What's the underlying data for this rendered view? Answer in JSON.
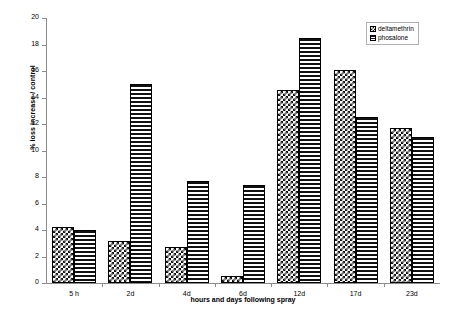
{
  "chart_data": {
    "type": "bar",
    "title": "",
    "xlabel": "hours and days following spray",
    "ylabel": "% loss increase / control",
    "categories": [
      "5 h",
      "2d",
      "4d",
      "6d",
      "12d",
      "17d",
      "23d"
    ],
    "series": [
      {
        "name": "deltamethrin",
        "values": [
          4.2,
          3.2,
          2.7,
          0.5,
          14.6,
          16.1,
          11.7
        ]
      },
      {
        "name": "phosalone",
        "values": [
          4.0,
          15.0,
          7.7,
          7.4,
          18.5,
          12.5,
          11.0
        ]
      }
    ],
    "ylim": [
      0,
      20
    ],
    "yticks": [
      0,
      2,
      4,
      6,
      8,
      10,
      12,
      14,
      16,
      18,
      20
    ],
    "ytick_labels": [
      "0",
      "2",
      "4",
      "6",
      "8",
      "10",
      "12",
      "14",
      "16",
      "18",
      "20"
    ],
    "grid": false,
    "legend_position": "top-right",
    "legend_entries": [
      "deltamethrin",
      "phosalone"
    ],
    "colors": {
      "series_0_pattern": "checkerboard",
      "series_1_pattern": "horizontal-stripes",
      "ink": "#111111",
      "axis": "#8c8c8c",
      "background": "#ffffff"
    }
  },
  "legend": {
    "items": [
      {
        "label": "deltamethrin"
      },
      {
        "label": "phosalone"
      }
    ]
  },
  "axes": {
    "y_title": "% loss increase / control",
    "x_title": "hours and days following spray"
  }
}
